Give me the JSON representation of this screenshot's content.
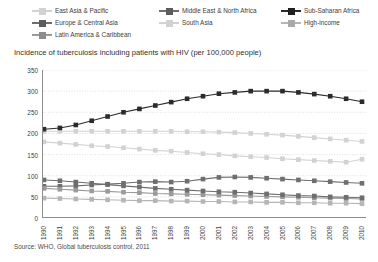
{
  "chart_data": {
    "type": "line",
    "title": "Incidence of tuberculosis including patients with HIV (per 100,000 people)",
    "source": "Source: WHO, Global tuberculosis control, 2011",
    "xlabel": "",
    "ylabel": "",
    "grid": true,
    "legend_position": "top",
    "ylim": [
      0,
      350
    ],
    "yticks": [
      0,
      50,
      100,
      150,
      200,
      250,
      300,
      350
    ],
    "x": [
      1990,
      1991,
      1992,
      1993,
      1994,
      1995,
      1996,
      1997,
      1998,
      1999,
      2000,
      2001,
      2002,
      2003,
      2004,
      2005,
      2006,
      2007,
      2008,
      2009,
      2010
    ],
    "categories": [
      "1990",
      "1991",
      "1992",
      "1993",
      "1994",
      "1995",
      "1996",
      "1997",
      "1998",
      "1999",
      "2000",
      "2001",
      "2002",
      "2003",
      "2004",
      "2005",
      "2006",
      "2007",
      "2008",
      "2009",
      "2010"
    ],
    "series": [
      {
        "name": "East Asia & Pacific",
        "color": "#d2d2d2",
        "values": [
          180,
          177,
          174,
          171,
          169,
          166,
          163,
          160,
          158,
          155,
          152,
          150,
          147,
          145,
          143,
          140,
          138,
          136,
          134,
          132,
          139
        ]
      },
      {
        "name": "Europe & Central Asia",
        "color": "#6e6e6e",
        "values": [
          75,
          75,
          76,
          78,
          80,
          82,
          85,
          86,
          85,
          87,
          92,
          96,
          97,
          96,
          94,
          92,
          90,
          88,
          86,
          84,
          82
        ]
      },
      {
        "name": "Latin America & Caribbean",
        "color": "#9a9a9a",
        "values": [
          70,
          68,
          66,
          64,
          63,
          61,
          60,
          58,
          57,
          56,
          55,
          54,
          53,
          52,
          51,
          50,
          49,
          48,
          47,
          46,
          45
        ]
      },
      {
        "name": "Middle East & North Africa",
        "color": "#6e6e6e",
        "values": [
          90,
          88,
          85,
          82,
          79,
          76,
          73,
          70,
          68,
          66,
          64,
          62,
          61,
          59,
          57,
          55,
          53,
          52,
          50,
          49,
          48
        ]
      },
      {
        "name": "South Asia",
        "color": "#d2d2d2",
        "values": [
          205,
          205,
          205,
          205,
          205,
          205,
          205,
          205,
          205,
          204,
          204,
          203,
          202,
          200,
          198,
          196,
          193,
          190,
          187,
          184,
          181
        ]
      },
      {
        "name": "Sub-Saharan Africa",
        "color": "#2b2b2b",
        "values": [
          210,
          213,
          220,
          230,
          240,
          250,
          258,
          266,
          274,
          282,
          288,
          294,
          297,
          300,
          300,
          300,
          297,
          293,
          288,
          282,
          275
        ]
      },
      {
        "name": "High-income",
        "color": "#b5b5b5",
        "values": [
          47,
          46,
          45,
          44,
          43,
          42,
          41,
          41,
          40,
          40,
          39,
          39,
          38,
          38,
          37,
          37,
          36,
          36,
          35,
          35,
          34
        ]
      }
    ]
  },
  "legend": {
    "items": [
      {
        "label": "East Asia & Pacific",
        "color": "#d2d2d2"
      },
      {
        "label": "Middle East & North Africa",
        "color": "#6e6e6e"
      },
      {
        "label": "Sub-Saharan Africa",
        "color": "#2b2b2b"
      },
      {
        "label": "Europe & Central Asia",
        "color": "#6e6e6e"
      },
      {
        "label": "South Asia",
        "color": "#d2d2d2"
      },
      {
        "label": "High-income",
        "color": "#b5b5b5"
      },
      {
        "label": "Latin America & Caribbean",
        "color": "#9a9a9a"
      }
    ]
  }
}
